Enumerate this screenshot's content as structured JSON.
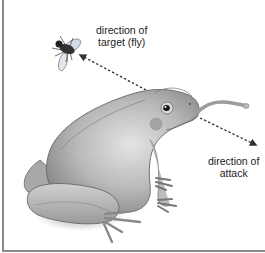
{
  "diagram": {
    "labels": {
      "target": {
        "line1": "direction of",
        "line2": "target (fly)"
      },
      "attack": {
        "line1": "direction of",
        "line2": "attack"
      }
    },
    "colors": {
      "frog_body": "#b5b5b5",
      "frog_shadow": "#7a7a7a",
      "arrow": "#333333",
      "border": "#8a8a8a"
    }
  }
}
